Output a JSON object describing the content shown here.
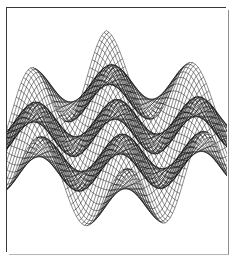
{
  "figure": {
    "title": "",
    "background_color": "#ffffff",
    "frame": {
      "border_color": "#3a3a3a",
      "shadow_color": "#8e8e8e",
      "x": 6,
      "y": 7,
      "width": 220,
      "height": 245
    }
  },
  "chart_data": {
    "type": "line",
    "subtype": "3d-wireframe-surface",
    "title": "",
    "xlabel": "",
    "ylabel": "",
    "zlabel": "",
    "grid": false,
    "legend": false,
    "axes_visible": false,
    "tick_labels": [],
    "annotations": [],
    "mesh_color": "#000000",
    "surface_fill": "none",
    "line_width": 0.45,
    "grid_nu": 64,
    "grid_nv": 64,
    "xlim": [
      -3.141592653589793,
      3.141592653589793
    ],
    "ylim": [
      -3.141592653589793,
      3.141592653589793
    ],
    "zlim": [
      -1.0,
      1.0
    ],
    "function": "z = cos(2.0*x) * cos(2.0*y)",
    "function_terms": [
      {
        "amplitude": 1.0,
        "x_freq": 2.0,
        "y_freq": 2.0,
        "x_phase": 0.0,
        "y_phase": 0.0
      }
    ],
    "projection": {
      "type": "oblique-parallel",
      "azimuth_deg": -52,
      "elevation_deg": 26,
      "z_scale": 0.62,
      "x_axis_screen": [
        1.62,
        0.6
      ],
      "y_axis_screen": [
        1.42,
        -0.7
      ],
      "z_axis_screen": [
        0.0,
        -1.0
      ],
      "origin_screen": [
        110,
        128
      ]
    },
    "peaks": [
      {
        "label": "back-center-peak",
        "screen_x": 85,
        "screen_y": 34,
        "relative_height": 1.0
      },
      {
        "label": "right-mid-peak",
        "screen_x": 158,
        "screen_y": 74,
        "relative_height": 0.82
      },
      {
        "label": "left-front-peak",
        "screen_x": 36,
        "screen_y": 89,
        "relative_height": 0.78
      },
      {
        "label": "center-ridge",
        "screen_x": 118,
        "screen_y": 112,
        "relative_height": 0.55
      }
    ],
    "troughs": [
      {
        "label": "front-center-valley",
        "screen_x": 110,
        "screen_y": 196,
        "relative_height": -0.95
      },
      {
        "label": "right-front-valley",
        "screen_x": 183,
        "screen_y": 158,
        "relative_height": -0.88
      },
      {
        "label": "left-valley",
        "screen_x": 55,
        "screen_y": 150,
        "relative_height": -0.7
      }
    ],
    "x": [],
    "values": [],
    "series": [
      {
        "name": "surface-mesh-u-lines",
        "description": "constant-y polylines of the wireframe",
        "count": 64
      },
      {
        "name": "surface-mesh-v-lines",
        "description": "constant-x polylines of the wireframe",
        "count": 64
      }
    ]
  }
}
